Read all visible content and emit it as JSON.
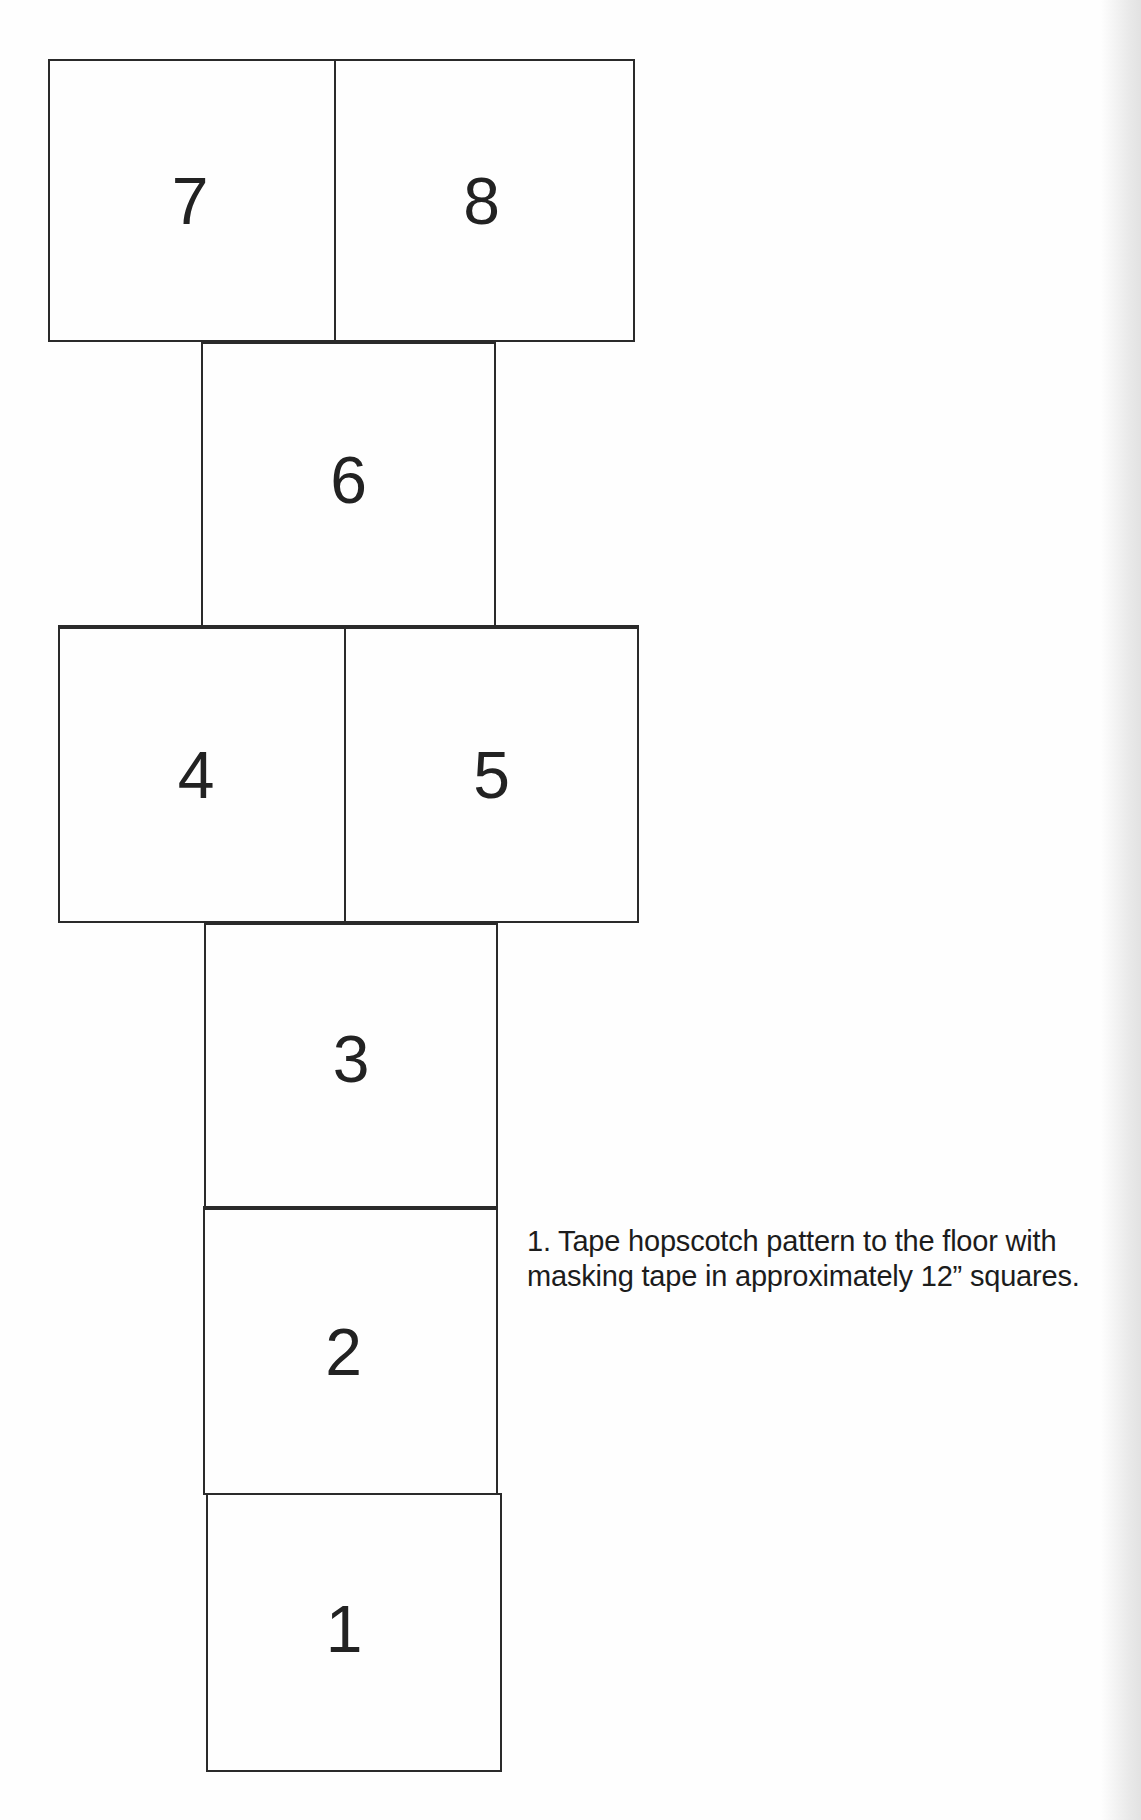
{
  "diagram": {
    "title": "Hopscotch pattern",
    "squares": [
      {
        "label": "7"
      },
      {
        "label": "8"
      },
      {
        "label": "6"
      },
      {
        "label": "4"
      },
      {
        "label": "5"
      },
      {
        "label": "3"
      },
      {
        "label": "2"
      },
      {
        "label": "1"
      }
    ],
    "instruction": "1. Tape hopscotch pattern to the floor with masking tape in approximately 12” squares."
  }
}
